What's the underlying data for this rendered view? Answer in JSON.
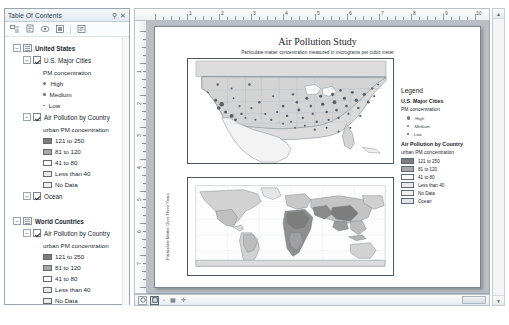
{
  "toc": {
    "title": "Table Of Contents",
    "pin_icon": "pin-icon",
    "close_icon": "close-icon",
    "toolbar": [
      {
        "name": "list-by-drawing-order-icon"
      },
      {
        "name": "list-by-source-icon"
      },
      {
        "name": "list-by-visibility-icon"
      },
      {
        "name": "list-by-selection-icon"
      },
      {
        "name": "options-icon"
      }
    ],
    "tree": [
      {
        "label": "United States",
        "type": "data-frame",
        "expanded": true,
        "children": [
          {
            "label": "U.S. Major Cities",
            "type": "layer",
            "checked": true,
            "expanded": true,
            "sublabel": "PM concentration",
            "symbols": [
              {
                "label": "High",
                "size": "hi"
              },
              {
                "label": "Medium",
                "size": "md"
              },
              {
                "label": "Low",
                "size": "lo"
              }
            ]
          },
          {
            "label": "Air Pollution by Country",
            "type": "layer",
            "checked": true,
            "expanded": true,
            "sublabel": "urban PM concentration",
            "classes": [
              {
                "label": "121 to 250",
                "color": "#7d7d7d"
              },
              {
                "label": "81 to 120",
                "color": "#a8a8a8"
              },
              {
                "label": "41 to 80",
                "color": "#f2f2f2"
              },
              {
                "label": "Less than 40",
                "color": "#e8e8e8"
              },
              {
                "label": "No Data",
                "color": "#ededed"
              }
            ]
          },
          {
            "label": "Ocean",
            "type": "layer",
            "checked": true,
            "expanded": true
          }
        ]
      },
      {
        "label": "World Countries",
        "type": "data-frame",
        "expanded": true,
        "children": [
          {
            "label": "Air Pollution by Country",
            "type": "layer",
            "checked": true,
            "expanded": true,
            "sublabel": "urban PM concentration",
            "classes": [
              {
                "label": "121 to 250",
                "color": "#7d7d7d"
              },
              {
                "label": "81 to 120",
                "color": "#a8a8a8"
              },
              {
                "label": "41 to 80",
                "color": "#f2f2f2"
              },
              {
                "label": "Less than 40",
                "color": "#e8e8e8"
              },
              {
                "label": "No Data",
                "color": "#ededed"
              }
            ]
          },
          {
            "label": "Ocean",
            "type": "layer",
            "checked": true,
            "expanded": true
          }
        ]
      }
    ]
  },
  "rulers": {
    "horizontal_ticks": [
      "1",
      "2",
      "3",
      "4",
      "5",
      "6",
      "7",
      "8",
      "9",
      "10"
    ],
    "vertical_ticks": [
      "1",
      "2",
      "3",
      "4",
      "5",
      "6",
      "7",
      "8"
    ],
    "units": "inches"
  },
  "layout": {
    "title": "Air Pollution Study",
    "subtitle": "Particulate matter concentration measured in micrograms per cubic meter",
    "side_label": "Particulate Matter Over Three Years",
    "us_map_name": "united-states-data-frame",
    "world_map_name": "world-countries-data-frame"
  },
  "legend": {
    "heading": "Legend",
    "sections": [
      {
        "title": "U.S. Major Cities",
        "subtitle": "PM concentration",
        "point_items": [
          {
            "label": "High",
            "size": "hi"
          },
          {
            "label": "Medium",
            "size": "md"
          },
          {
            "label": "Low",
            "size": "lo"
          }
        ]
      },
      {
        "title": "Air Pollution by Country",
        "subtitle": "urban PM concentration",
        "swatch_items": [
          {
            "label": "121 to 250",
            "color": "#7d7d7d"
          },
          {
            "label": "81 to 120",
            "color": "#a8a8a8"
          },
          {
            "label": "41 to 80",
            "color": "#fbfbfb"
          },
          {
            "label": "Less than 40",
            "color": "#e9e9e9"
          },
          {
            "label": "No Data",
            "color": "#efefef"
          },
          {
            "label": "Ocean",
            "color": "#e2e6e9"
          }
        ]
      }
    ]
  },
  "statusbar": {
    "layout_view_icon": "layout-view-icon",
    "data_view_icon": "data-view-icon",
    "tools": [
      "zoom-in-icon",
      "pan-icon",
      "select-icon"
    ]
  },
  "colors": {
    "panel_bg": "#ffffff",
    "canvas_bg": "#b9bfc4",
    "chrome": "#e3eaf0",
    "border": "#9aa4ad"
  }
}
